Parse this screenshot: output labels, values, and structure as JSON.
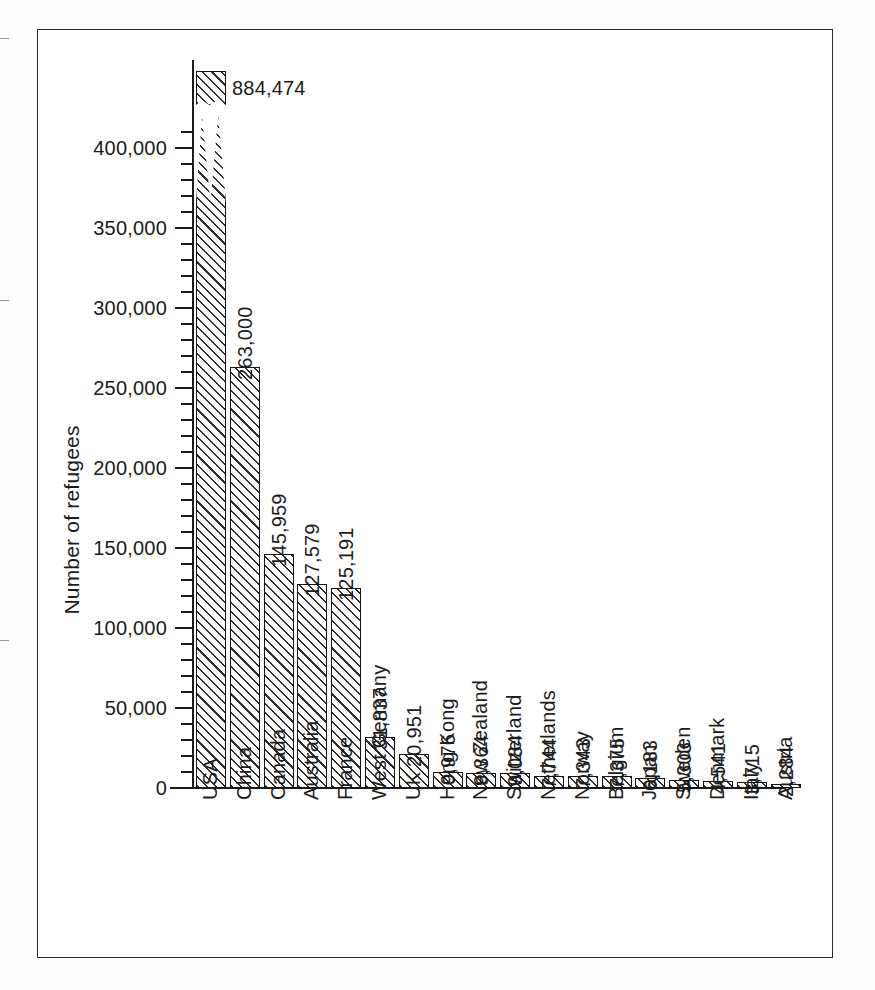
{
  "chart_data": {
    "type": "bar",
    "title": "",
    "subtitle": "",
    "xlabel": "",
    "ylabel": "Number of refugees",
    "ylim": [
      0,
      420000
    ],
    "ytick_step": 50000,
    "yminor_step": 10000,
    "grid": false,
    "legend": null,
    "broken_axis": true,
    "broken_axis_note": "USA bar is truncated with a zig-zag break; its true value 884,474 is printed at the top.",
    "ytick_labels": [
      "0",
      "50,000",
      "100,000",
      "150,000",
      "200,000",
      "250,000",
      "300,000",
      "350,000",
      "400,000"
    ],
    "ytick_values": [
      0,
      50000,
      100000,
      150000,
      200000,
      250000,
      300000,
      350000,
      400000
    ],
    "categories": [
      "USA",
      "China",
      "Canada",
      "Australia",
      "France",
      "West Germany",
      "UK",
      "Hong Kong",
      "New Zealand",
      "Switzerland",
      "Netherlands",
      "Norway",
      "Belgium",
      "Japan",
      "Sweden",
      "Denmark",
      "Italy",
      "Austria"
    ],
    "values": [
      884474,
      263000,
      145959,
      127579,
      125191,
      31837,
      20951,
      9976,
      9364,
      9084,
      7744,
      7343,
      7375,
      6183,
      5303,
      4541,
      3715,
      2284
    ],
    "value_labels": [
      "884,474",
      "263,000",
      "145,959",
      "127,579",
      "125,191",
      "31,837",
      "20,951",
      "9,976",
      "9,364",
      "9,084",
      "7,744",
      "7,343",
      "7,375",
      "6,183",
      "5,303",
      "4,541",
      "3,715",
      "2,284"
    ],
    "colors": {
      "bar_fill": "#ffffff",
      "bar_hatch": "#2e2e2e",
      "bar_stroke": "#141414",
      "axis": "#1c1c1c",
      "text": "#1c1c1c",
      "frame": "#2b2b2b",
      "page_background": "#fdfdfd"
    }
  }
}
